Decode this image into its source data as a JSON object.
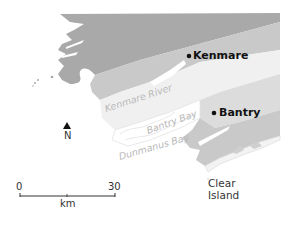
{
  "map": {
    "colors": {
      "land_dark": "#a9a9a9",
      "land_mid": "#c6c6c6",
      "land_light": "#d9d9d9",
      "estuary": "#efefef",
      "water_label": "#b8b8b8",
      "text": "#111111"
    },
    "towns": [
      {
        "name": "Kenmare"
      },
      {
        "name": "Bantry"
      }
    ],
    "water_features": [
      {
        "name": "Kenmare River"
      },
      {
        "name": "Bantry Bay"
      },
      {
        "name": "Dunmanus Bay"
      }
    ],
    "islands": [
      {
        "line1": "Clear",
        "line2": "Island"
      }
    ],
    "north_arrow": {
      "label": "N"
    },
    "scale_bar": {
      "start": "0",
      "end": "30",
      "unit": "km"
    }
  }
}
